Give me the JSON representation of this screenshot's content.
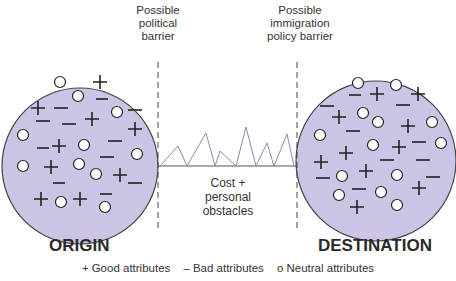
{
  "barriers": {
    "left": {
      "lines": [
        "Possible",
        "political",
        "barrier"
      ]
    },
    "right": {
      "lines": [
        "Possible",
        "immigration",
        "policy barrier"
      ]
    }
  },
  "middle": {
    "lines": [
      "Cost +",
      "personal",
      "obstacles"
    ]
  },
  "regions": {
    "origin": "ORIGIN",
    "destination": "DESTINATION"
  },
  "legend": {
    "good": {
      "symbol": "+",
      "label": "Good attributes"
    },
    "bad": {
      "symbol": "–",
      "label": "Bad attributes"
    },
    "neutral": {
      "symbol": "o",
      "label": "Neutral attributes"
    }
  },
  "colors": {
    "circle_fill": "#cdc3e4",
    "line": "#8f86b8"
  }
}
